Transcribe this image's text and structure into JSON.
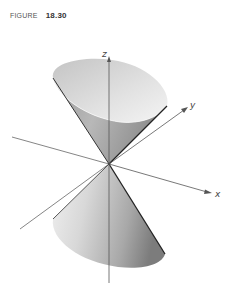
{
  "figure": {
    "label": "FIGURE",
    "number": "18.30"
  },
  "diagram": {
    "axes": {
      "x": "x",
      "y": "y",
      "z": "z"
    },
    "colors": {
      "axis": "#555555",
      "surface_light": "#eeeeee",
      "surface_dark": "#7a7a7a",
      "edge": "#333333"
    }
  }
}
